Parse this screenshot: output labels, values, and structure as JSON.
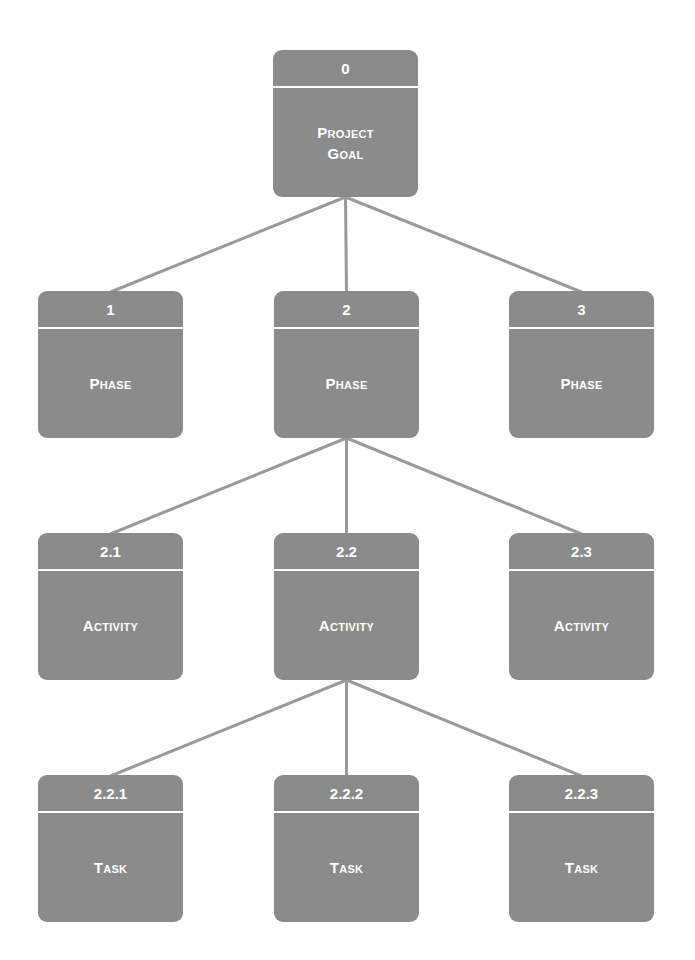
{
  "diagram": {
    "type": "work-breakdown-structure",
    "colors": {
      "node_fill": "#8b8b8b",
      "node_text": "#ffffff",
      "connector": "#9a9a9a",
      "background": "#ffffff"
    },
    "nodes": [
      {
        "key": "n0",
        "id": "0",
        "label": "Project\nGoal",
        "x": 273,
        "y": 50,
        "parent": null
      },
      {
        "key": "n1",
        "id": "1",
        "label": "Phase",
        "x": 38,
        "y": 291,
        "parent": "n0"
      },
      {
        "key": "n2",
        "id": "2",
        "label": "Phase",
        "x": 274,
        "y": 291,
        "parent": "n0"
      },
      {
        "key": "n3",
        "id": "3",
        "label": "Phase",
        "x": 509,
        "y": 291,
        "parent": "n0"
      },
      {
        "key": "n21",
        "id": "2.1",
        "label": "Activity",
        "x": 38,
        "y": 533,
        "parent": "n2"
      },
      {
        "key": "n22",
        "id": "2.2",
        "label": "Activity",
        "x": 274,
        "y": 533,
        "parent": "n2"
      },
      {
        "key": "n23",
        "id": "2.3",
        "label": "Activity",
        "x": 509,
        "y": 533,
        "parent": "n2"
      },
      {
        "key": "n221",
        "id": "2.2.1",
        "label": "Task",
        "x": 38,
        "y": 775,
        "parent": "n22"
      },
      {
        "key": "n222",
        "id": "2.2.2",
        "label": "Task",
        "x": 274,
        "y": 775,
        "parent": "n22"
      },
      {
        "key": "n223",
        "id": "2.2.3",
        "label": "Task",
        "x": 509,
        "y": 775,
        "parent": "n22"
      }
    ]
  }
}
